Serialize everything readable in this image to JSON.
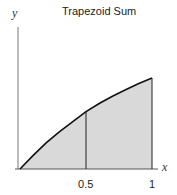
{
  "chart_data": {
    "type": "area",
    "title": "Trapezoid Sum",
    "xlabel": "x",
    "ylabel": "y",
    "x_ticks": [
      "0.5",
      "1"
    ],
    "xlim": [
      0,
      1
    ],
    "ylim": [
      0,
      1.5
    ],
    "grid": false,
    "curve": {
      "x": [
        0,
        0.1,
        0.2,
        0.3,
        0.4,
        0.5,
        0.6,
        0.7,
        0.8,
        0.9,
        1.0
      ],
      "y": [
        0,
        0.15,
        0.29,
        0.41,
        0.52,
        0.63,
        0.72,
        0.8,
        0.87,
        0.94,
        1.0
      ]
    },
    "trapezoids": [
      {
        "x0": 0,
        "x1": 0.5,
        "y0": 0,
        "y1": 0.63
      },
      {
        "x0": 0.5,
        "x1": 1.0,
        "y0": 0.63,
        "y1": 1.0
      }
    ],
    "colors": {
      "fill": "#d9d9d9",
      "curve": "#111111",
      "axis": "#555555"
    }
  }
}
